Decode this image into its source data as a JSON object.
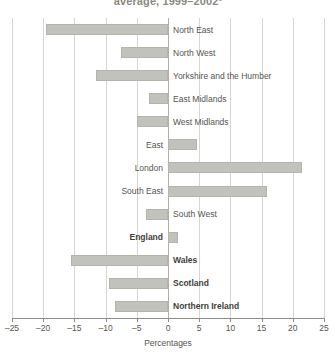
{
  "chart_data": {
    "type": "bar",
    "orientation": "horizontal",
    "title": "average, 1999–2002¹",
    "xlabel": "Percentages",
    "ylabel": "",
    "xlim": [
      -25,
      25
    ],
    "xticks": [
      -25,
      -20,
      -15,
      -10,
      -5,
      0,
      5,
      10,
      15,
      20,
      25
    ],
    "xtick_labels": [
      "–25",
      "–20",
      "–15",
      "–10",
      "–5",
      "0",
      "5",
      "10",
      "15",
      "20",
      "25"
    ],
    "grid": true,
    "legend": "none",
    "categories": [
      "North East",
      "North West",
      "Yorkshire and the Humber",
      "East Midlands",
      "West Midlands",
      "East",
      "London",
      "South East",
      "South West",
      "England",
      "Wales",
      "Scotland",
      "Northern Ireland"
    ],
    "values": [
      -19.5,
      -7.5,
      -11.5,
      -3.0,
      -5.0,
      4.6,
      21.5,
      15.8,
      -3.5,
      1.6,
      -15.5,
      -9.5,
      -8.5
    ],
    "emphasized": [
      "England",
      "Wales",
      "Scotland",
      "Northern Ireland"
    ],
    "bar_color": "#c2c2bd",
    "grid_color": "#d6d6d2",
    "axis_color": "#8d8d87"
  }
}
